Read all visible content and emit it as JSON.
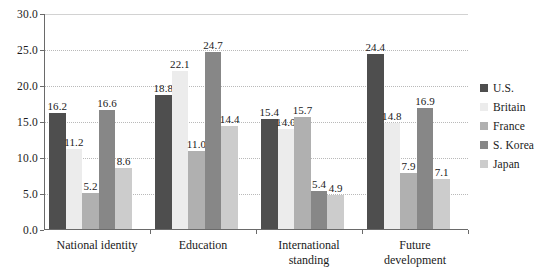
{
  "chart_data": {
    "type": "bar",
    "title": "",
    "subtitle": "",
    "xlabel": "",
    "ylabel": "",
    "ylim": [
      0.0,
      30.0
    ],
    "ytick_labels": [
      "0.0",
      "5.0",
      "10.0",
      "15.0",
      "20.0",
      "25.0",
      "30.0"
    ],
    "ytick_values": [
      0.0,
      5.0,
      10.0,
      15.0,
      20.0,
      25.0,
      30.0
    ],
    "grid": "horizontal-dotted",
    "legend_position": "right",
    "categories": [
      "National identity",
      "Education",
      "International\nstanding",
      "Future\ndevelopment"
    ],
    "series": [
      {
        "name": "U.S.",
        "color": "#4e4e4e",
        "values": [
          16.2,
          18.8,
          15.4,
          24.4
        ]
      },
      {
        "name": "Britain",
        "color": "#ececec",
        "values": [
          11.2,
          22.1,
          14.0,
          14.8
        ]
      },
      {
        "name": "France",
        "color": "#b0b0b0",
        "values": [
          5.2,
          11.0,
          15.7,
          7.9
        ]
      },
      {
        "name": "S. Korea",
        "color": "#878787",
        "values": [
          16.6,
          24.7,
          5.4,
          16.9
        ]
      },
      {
        "name": "Japan",
        "color": "#cccccc",
        "values": [
          8.6,
          14.4,
          4.9,
          7.1
        ]
      }
    ],
    "data_labels": [
      [
        "16.2",
        "11.2",
        "5.2",
        "16.6",
        "8.6"
      ],
      [
        "18.8",
        "22.1",
        "11.0",
        "24.7",
        "14.4"
      ],
      [
        "15.4",
        "14.0",
        "15.7",
        "5.4",
        "4.9"
      ],
      [
        "24.4",
        "14.8",
        "7.9",
        "16.9",
        "7.1"
      ]
    ]
  },
  "legend": {
    "items": [
      {
        "label": "U.S."
      },
      {
        "label": "Britain"
      },
      {
        "label": "France"
      },
      {
        "label": "S. Korea"
      },
      {
        "label": "Japan"
      }
    ]
  },
  "axes": {
    "y_labels": [
      "30.0",
      "25.0",
      "20.0",
      "15.0",
      "10.0",
      "5.0",
      "0.0"
    ],
    "x_labels": [
      "National identity",
      "Education",
      "International\nstanding",
      "Future\ndevelopment"
    ]
  }
}
